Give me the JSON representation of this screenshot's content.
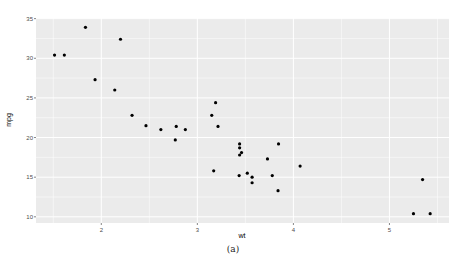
{
  "chart_data": {
    "type": "scatter",
    "title": "",
    "xlabel": "wt",
    "ylabel": "mpg",
    "xlim": [
      1.32,
      5.62
    ],
    "ylim": [
      9.22,
      35.08
    ],
    "xticks": [
      2,
      3,
      4,
      5
    ],
    "yticks": [
      10,
      15,
      20,
      25,
      30,
      35
    ],
    "grid": true,
    "theme": "ggplot2 grey",
    "points": [
      {
        "x": 2.62,
        "y": 21.0
      },
      {
        "x": 2.875,
        "y": 21.0
      },
      {
        "x": 2.32,
        "y": 22.8
      },
      {
        "x": 3.215,
        "y": 21.4
      },
      {
        "x": 3.44,
        "y": 18.7
      },
      {
        "x": 3.46,
        "y": 18.1
      },
      {
        "x": 3.57,
        "y": 14.3
      },
      {
        "x": 3.19,
        "y": 24.4
      },
      {
        "x": 3.15,
        "y": 22.8
      },
      {
        "x": 3.44,
        "y": 19.2
      },
      {
        "x": 3.44,
        "y": 17.8
      },
      {
        "x": 4.07,
        "y": 16.4
      },
      {
        "x": 3.73,
        "y": 17.3
      },
      {
        "x": 3.78,
        "y": 15.2
      },
      {
        "x": 5.25,
        "y": 10.4
      },
      {
        "x": 5.424,
        "y": 10.4
      },
      {
        "x": 5.345,
        "y": 14.7
      },
      {
        "x": 2.2,
        "y": 32.4
      },
      {
        "x": 1.615,
        "y": 30.4
      },
      {
        "x": 1.835,
        "y": 33.9
      },
      {
        "x": 2.465,
        "y": 21.5
      },
      {
        "x": 3.52,
        "y": 15.5
      },
      {
        "x": 3.435,
        "y": 15.2
      },
      {
        "x": 3.84,
        "y": 13.3
      },
      {
        "x": 3.845,
        "y": 19.2
      },
      {
        "x": 1.935,
        "y": 27.3
      },
      {
        "x": 2.14,
        "y": 26.0
      },
      {
        "x": 1.513,
        "y": 30.4
      },
      {
        "x": 3.17,
        "y": 15.8
      },
      {
        "x": 2.77,
        "y": 19.7
      },
      {
        "x": 3.57,
        "y": 15.0
      },
      {
        "x": 2.78,
        "y": 21.4
      }
    ],
    "point_color": "#000000",
    "panel_bg": "#ebebeb",
    "grid_color": "#ffffff"
  },
  "caption": "(a)"
}
